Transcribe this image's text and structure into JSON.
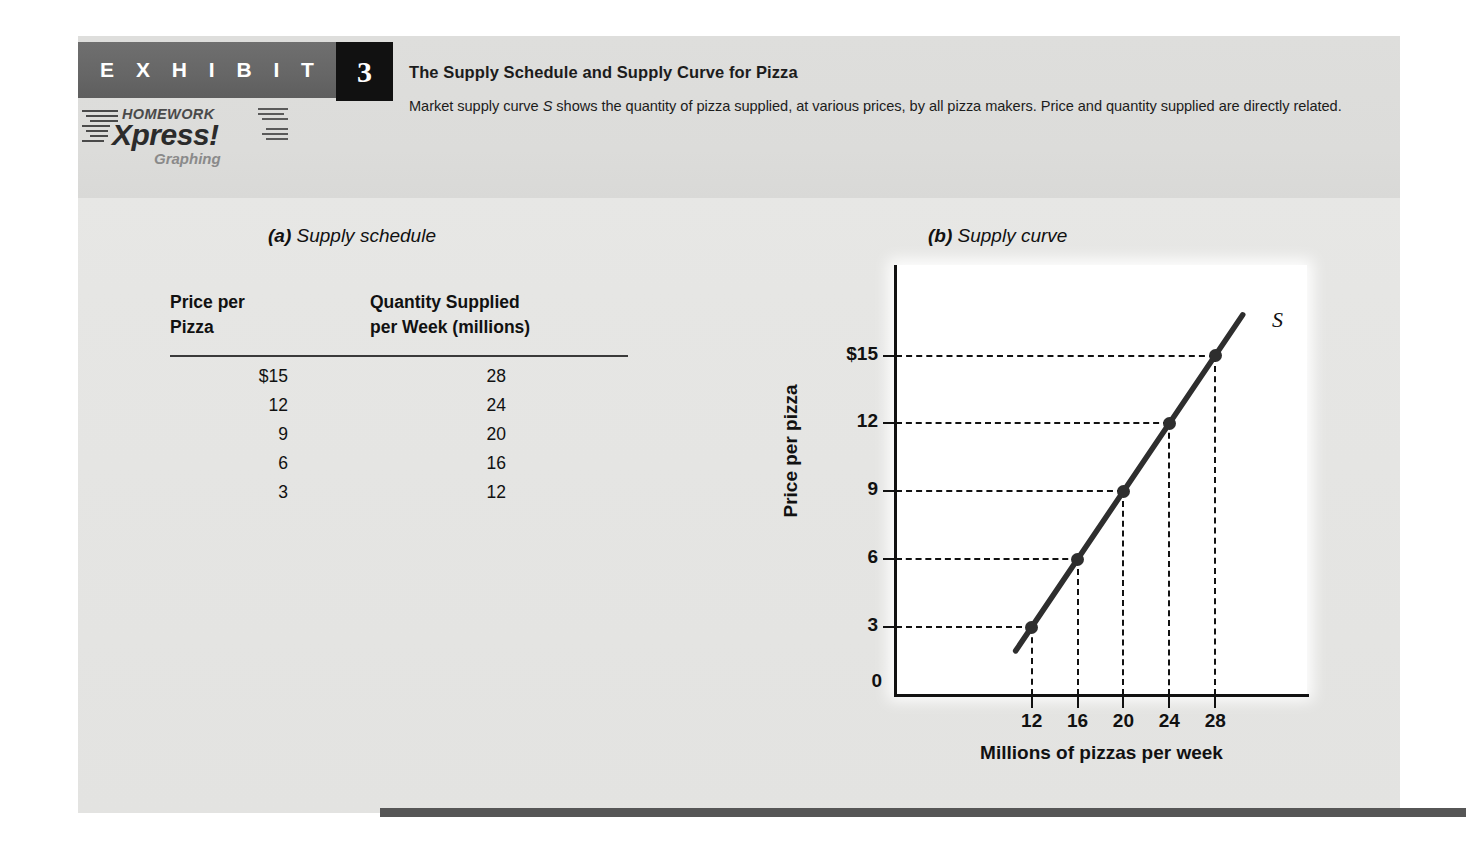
{
  "exhibit": {
    "label": "E X H I B I T",
    "number": "3",
    "title": "The Supply Schedule and Supply Curve for Pizza",
    "caption_part1": "Market supply curve ",
    "caption_italic": "S",
    "caption_part2": " shows the quantity of pizza supplied, at various prices, by all pizza makers. Price and quantity supplied are directly related."
  },
  "logo": {
    "line1": "HOMEWORK",
    "line2": "Xpress!",
    "line3": "Graphing"
  },
  "panel_a": {
    "heading_letter": "(a)",
    "heading_text": " Supply schedule",
    "table": {
      "col1_header_line1": "Price per",
      "col1_header_line2": "Pizza",
      "col2_header_line1": "Quantity Supplied",
      "col2_header_line2": "per Week (millions)",
      "rows": [
        {
          "price": "$15",
          "quantity": "28"
        },
        {
          "price": "12",
          "quantity": "24"
        },
        {
          "price": "9",
          "quantity": "20"
        },
        {
          "price": "6",
          "quantity": "16"
        },
        {
          "price": "3",
          "quantity": "12"
        }
      ]
    }
  },
  "panel_b": {
    "heading_letter": "(b)",
    "heading_text": " Supply curve",
    "zero_label": "0",
    "curve_label": "S"
  },
  "chart_data": {
    "type": "line",
    "title": "(b) Supply curve",
    "xlabel": "Millions of pizzas per week",
    "ylabel": "Price per pizza",
    "xlim": [
      0,
      36
    ],
    "ylim": [
      0,
      19
    ],
    "xticks": [
      "12",
      "16",
      "20",
      "24",
      "28"
    ],
    "xtick_values": [
      12,
      16,
      20,
      24,
      28
    ],
    "yticks": [
      "3",
      "6",
      "9",
      "12",
      "$15"
    ],
    "ytick_values": [
      3,
      6,
      9,
      12,
      15
    ],
    "grid": false,
    "legend": "none",
    "series": [
      {
        "name": "S",
        "x": [
          12,
          16,
          20,
          24,
          28
        ],
        "y": [
          3,
          6,
          9,
          12,
          15
        ],
        "marker": "filled-circle",
        "color": "#2e2e2e"
      }
    ],
    "annotations": [
      {
        "text": "S",
        "x": 31.5,
        "y": 17.2
      }
    ],
    "dashed_guides": true
  },
  "colors": {
    "paper": "#e5e5e3",
    "header_bar": "#666666",
    "badge": "#111111",
    "rule": "#565656",
    "curve": "#2e2e2e"
  }
}
